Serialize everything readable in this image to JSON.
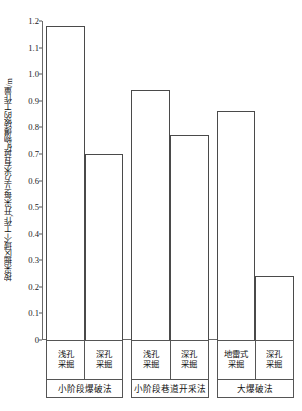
{
  "chart_data": {
    "type": "bar",
    "title": "",
    "xlabel": "",
    "ylabel": "按采掘区域个工作,开采每立方米有益矿物爆破的工作量/m",
    "ylim": [
      0,
      1.2
    ],
    "yticks": [
      "1.2",
      "1.1",
      "1.0",
      "0.9",
      "0.8",
      "0.7",
      "0.6",
      "0.5",
      "0.4",
      "0.3",
      "0.2",
      "0.1",
      "0"
    ],
    "ytick_values": [
      1.2,
      1.1,
      1.0,
      0.9,
      0.8,
      0.7,
      0.6,
      0.5,
      0.4,
      0.3,
      0.2,
      0.1,
      0
    ],
    "grid": false,
    "legend": "none",
    "categories": [
      "浅孔采掘",
      "深孔采掘",
      "浅孔采掘",
      "深孔采掘",
      "地雷式采掘",
      "深孔采掘"
    ],
    "values": [
      1.18,
      0.7,
      0.94,
      0.77,
      0.86,
      0.24
    ],
    "groups": [
      {
        "label": "小阶段爆破法",
        "bars": [
          {
            "line1": "浅孔",
            "line2": "采掘",
            "value": 1.18
          },
          {
            "line1": "深孔",
            "line2": "采掘",
            "value": 0.7
          }
        ]
      },
      {
        "label": "小阶段巷道开采法",
        "bars": [
          {
            "line1": "浅孔",
            "line2": "采掘",
            "value": 0.94
          },
          {
            "line1": "深孔",
            "line2": "采掘",
            "value": 0.77
          }
        ]
      },
      {
        "label": "大爆破法",
        "bars": [
          {
            "line1": "地雷式",
            "line2": "采掘",
            "value": 0.86
          },
          {
            "line1": "深孔",
            "line2": "采掘",
            "value": 0.24
          }
        ]
      }
    ],
    "colors": {
      "bar_fill": "#ffffff",
      "bar_edge": "#4a4a4a",
      "axis": "#6a6a6a",
      "text": "#1a1a1a",
      "background": "#ffffff"
    }
  }
}
